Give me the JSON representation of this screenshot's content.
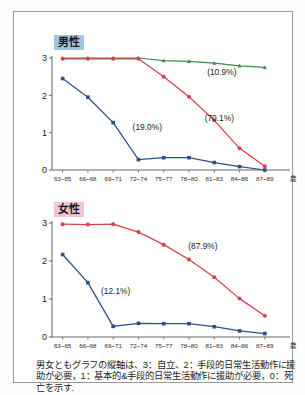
{
  "figure": {
    "caption": "男女ともグラフの縦軸は、3：自立、2：手段的日常生活動作に援助が必要，1：基本的&手段的日常生活動作に援助が必要，0：死亡を示す."
  },
  "panels": {
    "male": {
      "label": "男性",
      "badge_color": "#9ec7ea"
    },
    "female": {
      "label": "女性",
      "badge_color": "#f0c4d2"
    }
  },
  "chart_data": [
    {
      "id": "male",
      "type": "line",
      "title": "男性",
      "xlabel": "歳",
      "ylabel": "",
      "ylim": [
        0,
        3
      ],
      "yticks": [
        0,
        1,
        2,
        3
      ],
      "ytick_labels": [
        "0",
        "1",
        "2",
        "3"
      ],
      "grid": false,
      "legend": "annotations",
      "categories": [
        "63~65",
        "66~68",
        "69~71",
        "72~74",
        "75~77",
        "78~80",
        "81~83",
        "84~86",
        "87~89"
      ],
      "series": [
        {
          "name": "green-trajectory",
          "annotation": "(10.9%)",
          "annotation_x_index": 6.3,
          "annotation_y": 2.55,
          "color": "#3f8a4e",
          "marker": "triangle",
          "values": [
            3.0,
            3.0,
            3.0,
            3.0,
            2.93,
            2.91,
            2.86,
            2.79,
            2.75
          ]
        },
        {
          "name": "red-trajectory",
          "annotation": "(70.1%)",
          "annotation_x_index": 6.2,
          "annotation_y": 1.32,
          "color": "#d9414a",
          "marker": "circle",
          "values": [
            2.98,
            2.98,
            2.98,
            2.98,
            2.5,
            1.96,
            1.33,
            0.58,
            0.1
          ]
        },
        {
          "name": "blue-trajectory",
          "annotation": "(19.0%)",
          "annotation_x_index": 3.35,
          "annotation_y": 1.06,
          "color": "#2b4f86",
          "marker": "square",
          "values": [
            2.45,
            1.95,
            1.27,
            0.28,
            0.33,
            0.33,
            0.2,
            0.09,
            0.0
          ]
        }
      ]
    },
    {
      "id": "female",
      "type": "line",
      "title": "女性",
      "xlabel": "歳",
      "ylabel": "",
      "ylim": [
        0,
        3
      ],
      "yticks": [
        0,
        1,
        2,
        3
      ],
      "ytick_labels": [
        "0",
        "1",
        "2",
        "3"
      ],
      "grid": false,
      "legend": "annotations",
      "categories": [
        "63~65",
        "66~68",
        "69~71",
        "72~74",
        "75~77",
        "78~80",
        "81~83",
        "84~86",
        "87~89"
      ],
      "series": [
        {
          "name": "red-trajectory",
          "annotation": "(87.9%)",
          "annotation_x_index": 5.55,
          "annotation_y": 2.32,
          "color": "#d9414a",
          "marker": "circle",
          "values": [
            2.97,
            2.96,
            2.97,
            2.76,
            2.43,
            2.04,
            1.57,
            1.01,
            0.56
          ]
        },
        {
          "name": "blue-trajectory",
          "annotation": "(12.1%)",
          "annotation_x_index": 2.1,
          "annotation_y": 1.13,
          "color": "#2b4f86",
          "marker": "square",
          "values": [
            2.17,
            1.43,
            0.28,
            0.36,
            0.35,
            0.35,
            0.27,
            0.16,
            0.09
          ]
        }
      ]
    }
  ]
}
